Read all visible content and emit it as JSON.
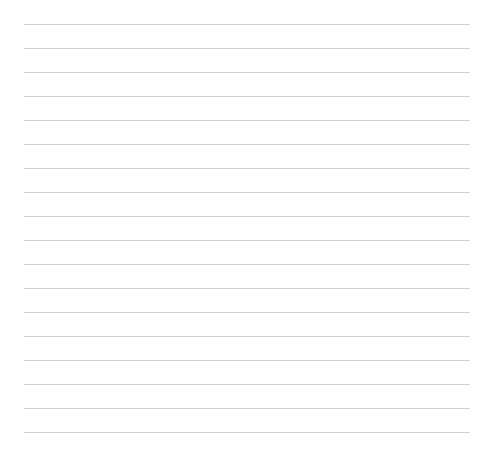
{
  "page": {
    "type": "lined-paper",
    "line_count": 18,
    "line_color": "#d2d2d2",
    "background_color": "#ffffff",
    "first_line_y": 24,
    "line_spacing": 24,
    "line_left": 24,
    "line_width": 446
  }
}
